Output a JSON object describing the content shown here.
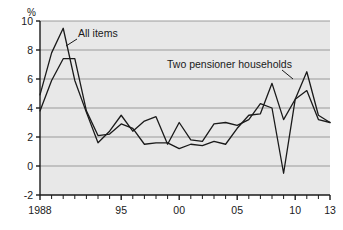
{
  "chart_data": {
    "type": "line",
    "title": "",
    "xlabel": "",
    "ylabel": "%",
    "unit_label": "%",
    "xlim": [
      1988,
      2013
    ],
    "ylim": [
      -2,
      10
    ],
    "ytick_values": [
      10,
      8,
      6,
      4,
      2,
      0,
      -2
    ],
    "ytick_labels": [
      "10",
      "8",
      "6",
      "4",
      "2",
      "0",
      "-2"
    ],
    "xtick_values": [
      1988,
      1995,
      2000,
      2005,
      2010,
      2013
    ],
    "xtick_labels": [
      "1988",
      "95",
      "00",
      "05",
      "10",
      "13"
    ],
    "x_minor_ticks_every": 1,
    "grid": "horizontal",
    "legend_position": "inline-annotations",
    "plot_background": "#e8e8e8",
    "page_background": "#ffffff",
    "grid_color": "#9a9a9a",
    "axis_color": "#1a1a1a",
    "x": [
      1988,
      1989,
      1990,
      1991,
      1992,
      1993,
      1994,
      1995,
      1996,
      1997,
      1998,
      1999,
      2000,
      2001,
      2002,
      2003,
      2004,
      2005,
      2006,
      2007,
      2008,
      2009,
      2010,
      2011,
      2012,
      2013
    ],
    "series": [
      {
        "name": "All items",
        "color": "#1a1a1a",
        "annotation": "All items",
        "values": [
          4.9,
          7.8,
          9.5,
          5.9,
          3.7,
          1.6,
          2.4,
          3.5,
          2.4,
          3.1,
          3.4,
          1.5,
          3.0,
          1.8,
          1.7,
          2.9,
          3.0,
          2.8,
          3.2,
          4.3,
          4.0,
          -0.5,
          4.6,
          5.2,
          3.2,
          3.0
        ]
      },
      {
        "name": "Two pensioner households",
        "color": "#1a1a1a",
        "annotation": "Two pensioner households",
        "values": [
          3.8,
          5.9,
          7.4,
          7.4,
          3.8,
          2.1,
          2.2,
          2.9,
          2.6,
          1.5,
          1.6,
          1.6,
          1.2,
          1.5,
          1.4,
          1.7,
          1.5,
          2.6,
          3.5,
          3.6,
          5.7,
          3.2,
          4.6,
          6.5,
          3.5,
          3.0
        ]
      }
    ],
    "annotations": [
      {
        "text": "All items",
        "label_x_px": 78,
        "label_y_px": 37,
        "leader_from_px": [
          77,
          39
        ],
        "leader_to_px": [
          66,
          46
        ]
      },
      {
        "text": "Two pensioner households",
        "label_x_px": 167,
        "label_y_px": 68,
        "leader_from_px": [
          282,
          70
        ],
        "leader_to_px": [
          293,
          79
        ]
      }
    ]
  }
}
